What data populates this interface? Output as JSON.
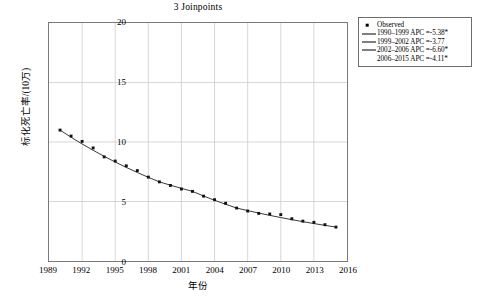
{
  "chart_data": {
    "type": "scatter",
    "title": "3 Joinpoints",
    "xlabel": "年份",
    "ylabel": "标化死亡率/(10万)",
    "xlim": [
      1989,
      2016
    ],
    "ylim": [
      0,
      20
    ],
    "xticks": [
      1989,
      1992,
      1995,
      1998,
      2001,
      2004,
      2007,
      2010,
      2013,
      2016
    ],
    "yticks": [
      0,
      5,
      10,
      15,
      20
    ],
    "grid": true,
    "legend_position": "outside-top-right",
    "x": [
      1990,
      1991,
      1992,
      1993,
      1994,
      1995,
      1996,
      1997,
      1998,
      1999,
      2000,
      2001,
      2002,
      2003,
      2004,
      2005,
      2006,
      2007,
      2008,
      2009,
      2010,
      2011,
      2012,
      2013,
      2014,
      2015
    ],
    "series": [
      {
        "name": "Observed",
        "values": [
          11.0,
          10.5,
          10.05,
          9.5,
          8.75,
          8.4,
          8.0,
          7.6,
          7.05,
          6.65,
          6.35,
          6.05,
          5.85,
          5.45,
          5.15,
          4.85,
          4.45,
          4.2,
          4.0,
          3.95,
          3.9,
          3.55,
          3.35,
          3.25,
          3.05,
          2.85
        ]
      }
    ],
    "joinpoints": [
      1999,
      2002,
      2006
    ],
    "segments": [
      {
        "range": "1990-1999",
        "apc": -5.38,
        "significant": true
      },
      {
        "range": "1999-2002",
        "apc": -3.77,
        "significant": false
      },
      {
        "range": "2002-2006",
        "apc": -6.6,
        "significant": true
      },
      {
        "range": "2006-2015",
        "apc": -4.11,
        "significant": true
      }
    ]
  },
  "legend": {
    "items": [
      {
        "key": "marker",
        "label": "Observed"
      },
      {
        "key": "line",
        "label": "1990–1999 APC =-5.38*"
      },
      {
        "key": "line",
        "label": "1999–2002 APC =-3.77"
      },
      {
        "key": "line",
        "label": "2002–2006 APC =-6.60*"
      },
      {
        "key": "none",
        "label": "2006–2015 APC =-4.11*"
      }
    ]
  },
  "colors": {
    "marker": "#111111",
    "fit_line": "#222222",
    "grid": "#cccccc",
    "frame": "#7a7a7a",
    "background": "#ffffff"
  }
}
